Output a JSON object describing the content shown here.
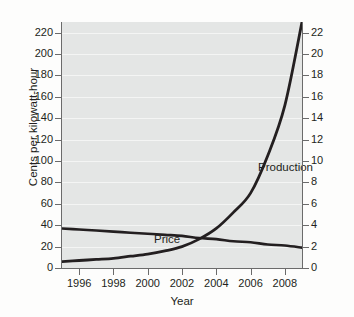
{
  "chart_data": {
    "type": "line",
    "title": "",
    "xlabel": "Year",
    "ylabel": "Cents per kilowatt-hour",
    "ylabel_right": "Global solar power capacity (gigawatts)",
    "xlim": [
      1995,
      2009
    ],
    "ylim": [
      0,
      230
    ],
    "ylim_right": [
      0,
      23
    ],
    "xticks": [
      1996,
      1998,
      2000,
      2002,
      2004,
      2006,
      2008
    ],
    "yticks": [
      0,
      20,
      40,
      60,
      80,
      100,
      120,
      140,
      160,
      180,
      200,
      220
    ],
    "yticks_right": [
      0,
      2,
      4,
      6,
      8,
      10,
      12,
      14,
      16,
      18,
      20,
      22
    ],
    "grid": true,
    "legend_position": "inline-annotations",
    "series": [
      {
        "name": "Price",
        "axis": "left",
        "units": "cents per kilowatt-hour",
        "x": [
          1995,
          1996,
          1997,
          1998,
          1999,
          2000,
          2001,
          2002,
          2003,
          2004,
          2005,
          2006,
          2007,
          2008,
          2009
        ],
        "values": [
          37,
          36,
          35,
          34,
          33,
          32,
          31,
          30,
          28,
          27,
          25,
          24,
          22,
          21,
          19
        ]
      },
      {
        "name": "Production",
        "axis": "right",
        "units": "gigawatts",
        "x": [
          1995,
          1996,
          1997,
          1998,
          1999,
          2000,
          2001,
          2002,
          2003,
          2004,
          2005,
          2006,
          2007,
          2008,
          2009
        ],
        "values": [
          0.6,
          0.7,
          0.8,
          0.9,
          1.1,
          1.3,
          1.6,
          2.0,
          2.7,
          3.7,
          5.2,
          7.0,
          10.5,
          15.2,
          23.0
        ]
      }
    ],
    "annotations": [
      {
        "text": "Price",
        "x": 1996.6,
        "y": 44
      },
      {
        "text": "Production",
        "x": 2003.1,
        "y": 116
      }
    ]
  },
  "axes": {
    "left_title": "Cents per kilowatt-hour",
    "right_title": "Global solar power capacity (gigawatts)",
    "bottom_title": "Year"
  },
  "tick_labels": {
    "left": [
      "220",
      "200",
      "180",
      "160",
      "140",
      "120",
      "100",
      "80",
      "60",
      "40",
      "20",
      "0"
    ],
    "right": [
      "22",
      "20",
      "18",
      "16",
      "14",
      "12",
      "10",
      "8",
      "6",
      "4",
      "2",
      "0"
    ],
    "bottom": [
      "1996",
      "1998",
      "2000",
      "2002",
      "2004",
      "2006",
      "2008"
    ]
  },
  "labels": {
    "price": "Price",
    "production": "Production"
  },
  "colors": {
    "plot_background": "#e4e6e5",
    "gridline": "#f4f5f4",
    "axis": "#6b6b6b",
    "series_line": "#231f20",
    "text": "#231f20",
    "page_background": "#fdfdfc"
  }
}
